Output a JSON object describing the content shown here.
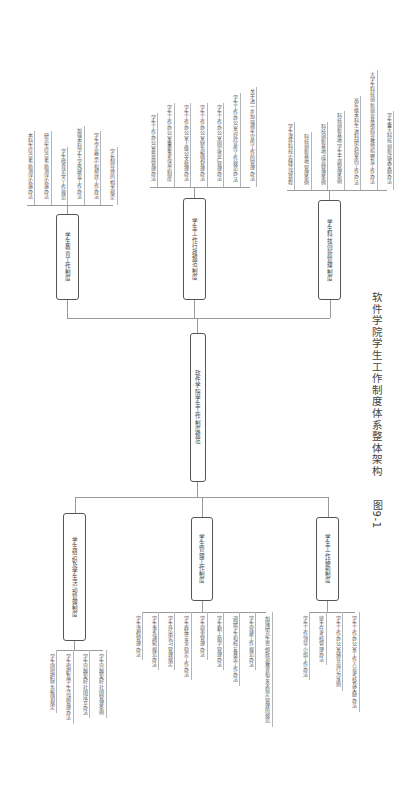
{
  "diagram": {
    "caption_number": "图9-1",
    "caption_title": "软件学院学生工作制度体系整体架构",
    "root": "软件学院学生工作制度规范",
    "branches": [
      {
        "label": "学生教育工作制度",
        "items": [
          "本科生综合素质测评实施办法",
          "研究生综合素质测评实施办法",
          "学生德育论文工作规范",
          "加强本科学生学风建设工作办法",
          "学生学业警示和帮扶工作办法",
          "学长制导师的相关规定"
        ]
      },
      {
        "label": "学生工作行政规范制度",
        "items": [
          "学生工作办公室签章管理办法",
          "学生工作办公室重要事务请示制度",
          "学生工作办公室上级公文处理办法",
          "学生工作办公室财务报销管理办法",
          "学生工作办公室固定资产管理办法",
          "学生工作办公室对外宣传工作规范办法",
          "关于进一步加强师生宣传工作的管理办法"
        ]
      },
      {
        "label": "学生科技创新管理制度",
        "items": [
          "学生课外科技实践活动章程",
          "科技创新基地管理条例",
          "科技创新基地成员管理条例",
          "科技创新基地学生干部管理条例",
          "高年级本科生进科研实验室的工作办法",
          "大学生科技创新创业基地指导教师招聘及工作办法",
          "学生重大科技创新成果奖励办法"
        ]
      },
      {
        "label": "学生组织及学生活动管理制度",
        "items": [
          "学生团组织财务报销规定",
          "学生组织及学生活动管理办法",
          "学生兴趣爱好社团成立办法",
          "学生兴趣爱好社团管理条例"
        ]
      },
      {
        "label": "学生管理工作制度",
        "items": [
          "学生请假管理办法",
          "学生事务通知规范办法",
          "学生外出实习管理规定",
          "学生群体安全稳定工作办法",
          "学生宿舍管理办法",
          "学生勤工助学管理办法",
          "调研学生和校友意见工作办法",
          "学生党建工作规范办法",
          "加强研究生思想政治教育和安全稳定管理的规范"
        ]
      },
      {
        "label": "学生工作辅助制度",
        "items": [
          "学生工作领导小组工作办法",
          "班主任考核管理办法",
          "学生工作办公室辅导员行为准则",
          "学生工作办公室工作人员考核及奖励办法"
        ]
      }
    ]
  }
}
